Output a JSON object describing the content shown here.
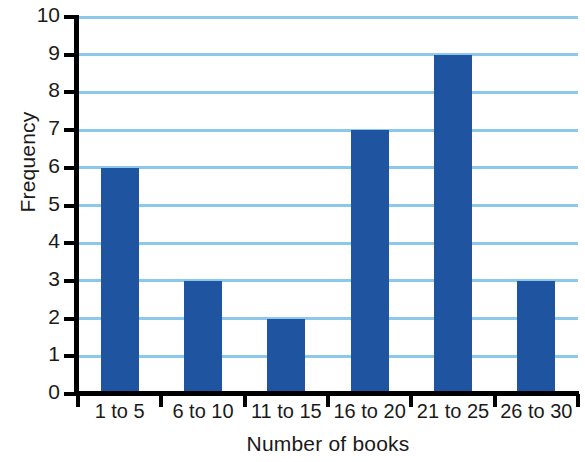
{
  "chart_data": {
    "type": "bar",
    "title": "",
    "categories": [
      "1 to 5",
      "6 to 10",
      "11 to 15",
      "16 to 20",
      "21 to 25",
      "26 to 30"
    ],
    "values": [
      6,
      3,
      2,
      7,
      9,
      3
    ],
    "xlabel": "Number of books",
    "ylabel": "Frequency",
    "ylim": [
      0,
      10
    ],
    "ytick_step": 1,
    "yticks": [
      "0",
      "1",
      "2",
      "3",
      "4",
      "5",
      "6",
      "7",
      "8",
      "9",
      "10"
    ],
    "grid": true,
    "grid_axis": "y",
    "legend": false,
    "colors": {
      "bar": "#1F55A0",
      "gridline": "#8CC8EC",
      "axis": "#000000",
      "text": "#1a1a1a",
      "background": "#ffffff"
    }
  }
}
